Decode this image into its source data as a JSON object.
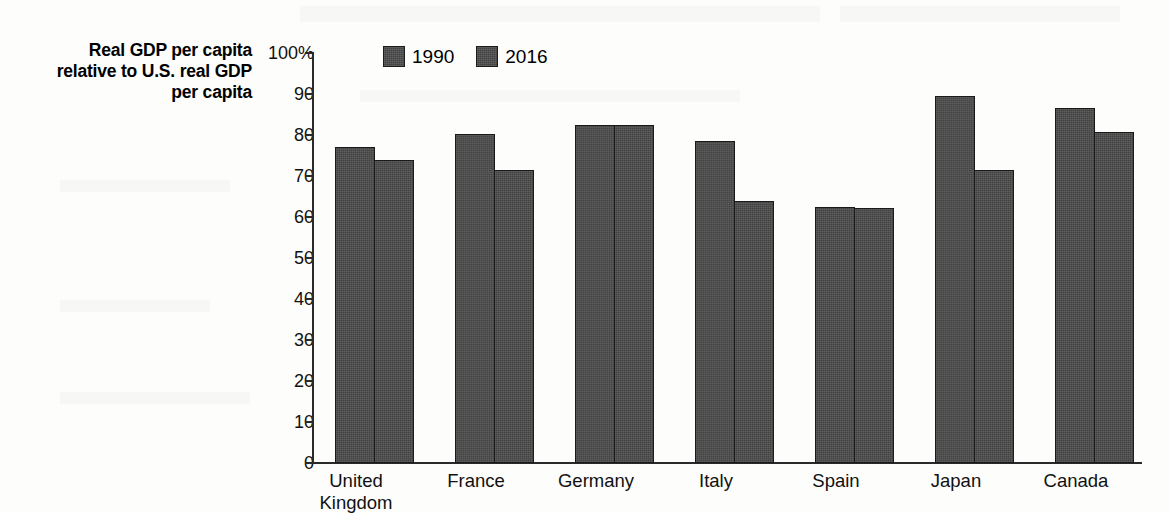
{
  "chart_data": {
    "type": "bar",
    "title": "",
    "subtitle": "",
    "ylabel": "Real GDP per capita relative to U.S. real GDP per capita",
    "ylabel_lines": [
      "Real GDP per capita",
      "relative to U.S. real GDP",
      "per capita"
    ],
    "xlabel": "",
    "ylim": [
      0,
      100
    ],
    "yticks": [
      0,
      10,
      20,
      30,
      40,
      50,
      60,
      70,
      80,
      90,
      100
    ],
    "ytick_labels": [
      "0",
      "10",
      "20",
      "30",
      "40",
      "50",
      "60",
      "70",
      "80",
      "90",
      "100%"
    ],
    "grid": false,
    "legend_position": "top-left-inside",
    "categories": [
      "United Kingdom",
      "France",
      "Germany",
      "Italy",
      "Spain",
      "Japan",
      "Canada"
    ],
    "category_lines": [
      [
        "United",
        "Kingdom"
      ],
      [
        "France"
      ],
      [
        "Germany"
      ],
      [
        "Italy"
      ],
      [
        "Spain"
      ],
      [
        "Japan"
      ],
      [
        "Canada"
      ]
    ],
    "series": [
      {
        "name": "1990",
        "color": "#4a4a4a",
        "values": [
          77.0,
          80.0,
          82.2,
          78.3,
          62.3,
          89.2,
          86.5
        ]
      },
      {
        "name": "2016",
        "color": "#4a4a4a",
        "values": [
          73.7,
          71.3,
          82.2,
          63.8,
          62.0,
          71.3,
          80.6
        ]
      }
    ]
  },
  "legend": {
    "entries": [
      {
        "label": "1990",
        "swatch": "legend-swatch-1990"
      },
      {
        "label": "2016",
        "swatch": "legend-swatch-2016"
      }
    ]
  }
}
